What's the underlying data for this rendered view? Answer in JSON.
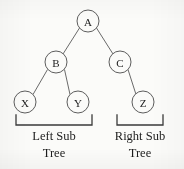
{
  "diagram": {
    "type": "binary-tree",
    "background_color": "#fbfbf9",
    "node_stroke_color": "#5d5d5d",
    "edge_stroke_color": "#6a6a6a",
    "text_color": "#1c1c1c",
    "bracket_color": "#3a3a3a",
    "nodes": [
      {
        "id": "A",
        "label": "A",
        "cx": 88,
        "cy": 21,
        "r": 11
      },
      {
        "id": "B",
        "label": "B",
        "cx": 56,
        "cy": 62,
        "r": 11
      },
      {
        "id": "C",
        "label": "C",
        "cx": 120,
        "cy": 62,
        "r": 11
      },
      {
        "id": "X",
        "label": "X",
        "cx": 25,
        "cy": 102,
        "r": 11
      },
      {
        "id": "Y",
        "label": "Y",
        "cx": 78,
        "cy": 102,
        "r": 11
      },
      {
        "id": "Z",
        "label": "Z",
        "cx": 143,
        "cy": 102,
        "r": 11
      }
    ],
    "edges": [
      {
        "from": "A",
        "to": "B",
        "x1": 79.5,
        "y1": 28,
        "x2": 63,
        "y2": 54
      },
      {
        "from": "A",
        "to": "C",
        "x1": 96.5,
        "y1": 28,
        "x2": 113,
        "y2": 54
      },
      {
        "from": "B",
        "to": "X",
        "x1": 47.5,
        "y1": 69.5,
        "x2": 33,
        "y2": 94.5
      },
      {
        "from": "B",
        "to": "Y",
        "x1": 64.5,
        "y1": 69.5,
        "x2": 70,
        "y2": 94.5
      },
      {
        "from": "C",
        "to": "Z",
        "x1": 128,
        "y1": 69.5,
        "x2": 136,
        "y2": 94.5
      }
    ],
    "brackets": [
      {
        "id": "left-subtree-bracket",
        "x_start": 16,
        "x_end": 92,
        "y_line": 125,
        "tick_top": 115
      },
      {
        "id": "right-subtree-bracket",
        "x_start": 117,
        "x_end": 163,
        "y_line": 125,
        "tick_top": 115
      }
    ],
    "captions": [
      {
        "id": "left-subtree-caption",
        "line1": "Left Sub",
        "line2": "Tree",
        "cx": 54,
        "y1": 140,
        "y2": 157
      },
      {
        "id": "right-subtree-caption",
        "line1": "Right Sub",
        "line2": "Tree",
        "cx": 140,
        "y1": 140,
        "y2": 157
      }
    ]
  }
}
